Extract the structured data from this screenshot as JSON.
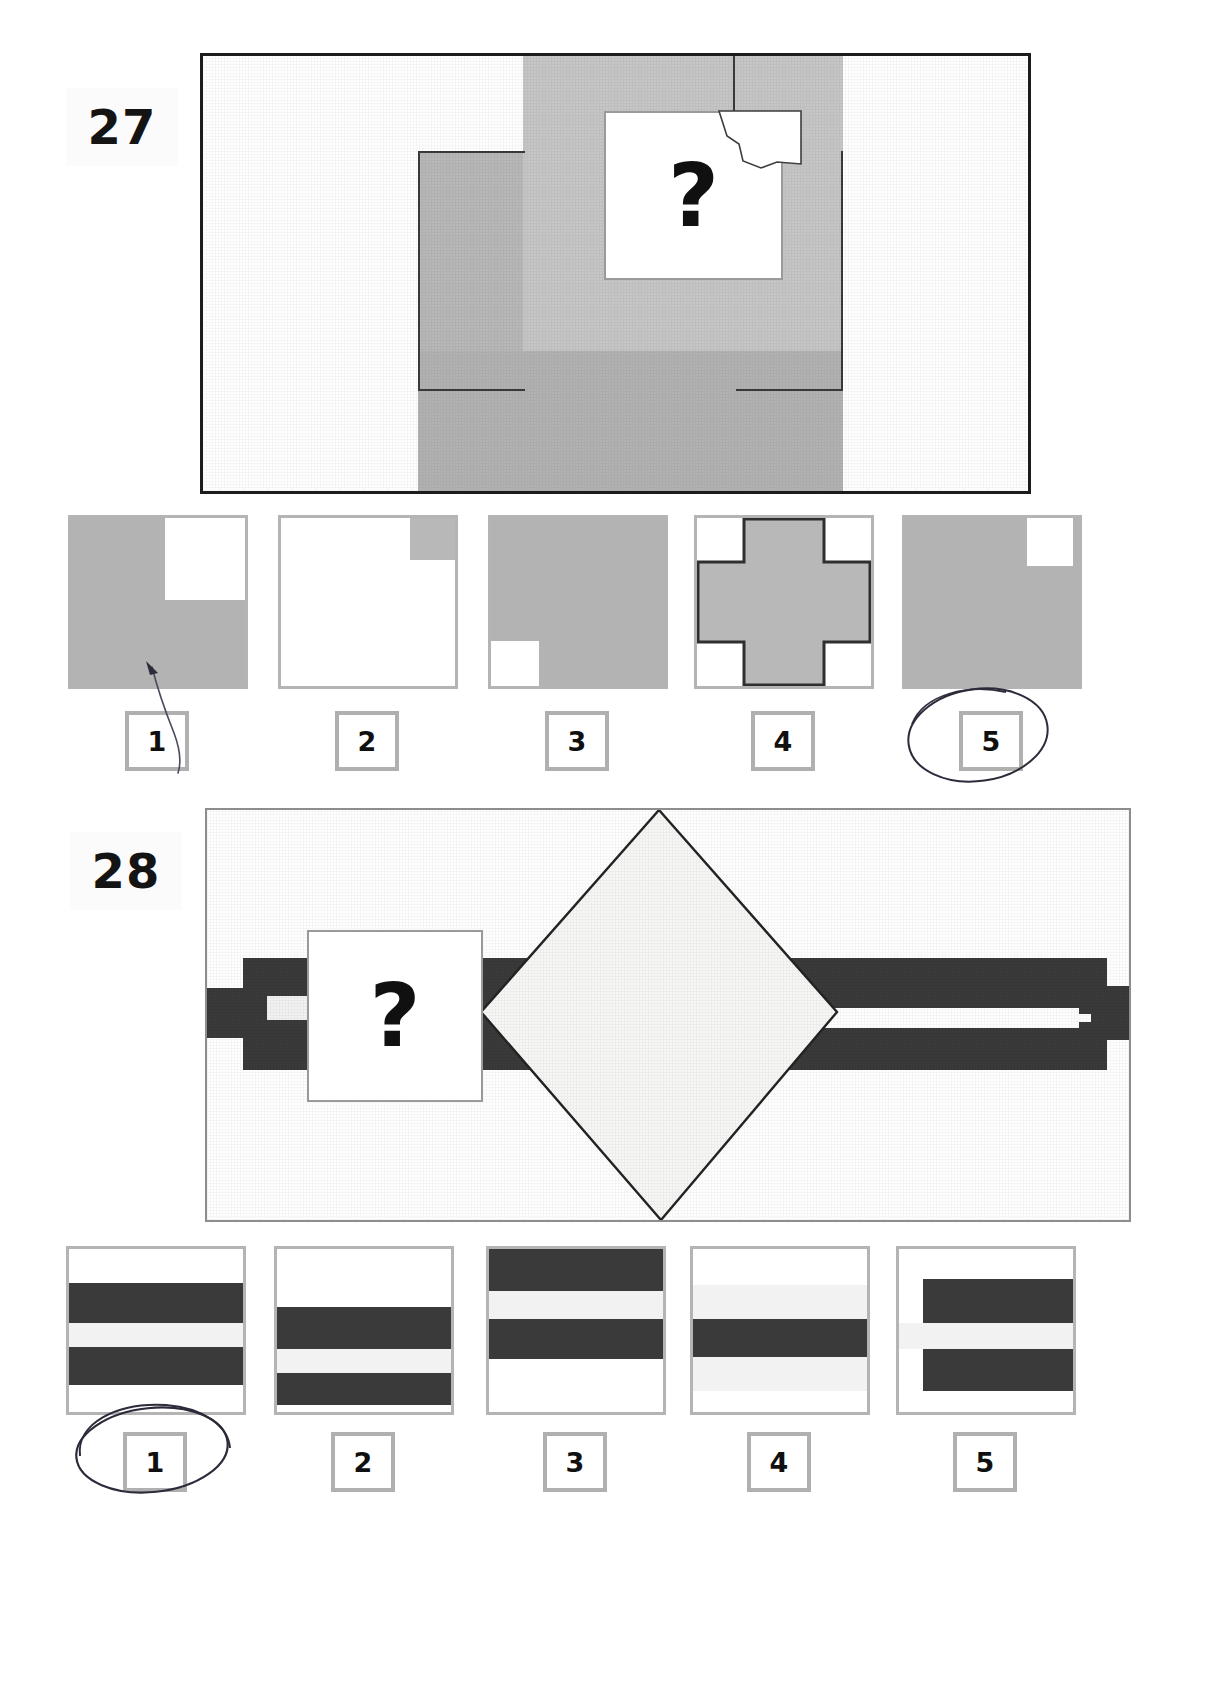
{
  "page": {
    "background": "#ffffff",
    "width": 1229,
    "height": 1694
  },
  "colors": {
    "gray_fill": "#b3b3b3",
    "gray_fill_light": "#c4c4c4",
    "dark_band": "#3a3a3a",
    "light_band": "#f2f2f2",
    "white": "#ffffff",
    "frame_dark": "#1c1c1c",
    "frame_light": "#8d8d8d",
    "option_border": "#b4b4b4",
    "number_border": "#b0b0b0",
    "ink": "#2b2b3a",
    "text": "#101010"
  },
  "questions": [
    {
      "id": "q27",
      "number": "27",
      "prompt_symbol": "?",
      "stimulus": {
        "description": "large white rectangle containing a gray cross/plus shape with a white question-mark card overlapping its upper right and a small torn white paper scrap",
        "frame_style": "dark",
        "figure_type": "gray-cross"
      },
      "options": [
        {
          "label": "1",
          "pattern": "gray-square-white-upper-right-quadrant"
        },
        {
          "label": "2",
          "pattern": "white-square-small-gray-upper-right-corner"
        },
        {
          "label": "3",
          "pattern": "gray-square-white-lower-left-block"
        },
        {
          "label": "4",
          "pattern": "gray-cross-white-corners"
        },
        {
          "label": "5",
          "pattern": "gray-square-white-upper-right-block"
        }
      ],
      "marked_answer": "5",
      "ink_marks": [
        "arrow-to-option-1",
        "circle-around-option-5"
      ]
    },
    {
      "id": "q28",
      "number": "28",
      "prompt_symbol": "?",
      "stimulus": {
        "description": "white rectangle with horizontal dark bands crossing it and a large white diamond overlapping the centre; a white question-mark card sits on the left bands",
        "frame_style": "light",
        "figure_type": "bands-and-diamond"
      },
      "options": [
        {
          "label": "1",
          "bands": [
            "white",
            "dark",
            "light",
            "dark",
            "white"
          ]
        },
        {
          "label": "2",
          "bands": [
            "white",
            "dark",
            "light",
            "dark",
            "white"
          ]
        },
        {
          "label": "3",
          "bands": [
            "dark",
            "light",
            "dark",
            "white"
          ]
        },
        {
          "label": "4",
          "bands": [
            "white",
            "light",
            "dark",
            "light",
            "white"
          ]
        },
        {
          "label": "5",
          "bands": [
            "white",
            "dark",
            "light",
            "dark",
            "white"
          ]
        }
      ],
      "marked_answer": "1",
      "ink_marks": [
        "circle-around-option-1"
      ]
    }
  ]
}
